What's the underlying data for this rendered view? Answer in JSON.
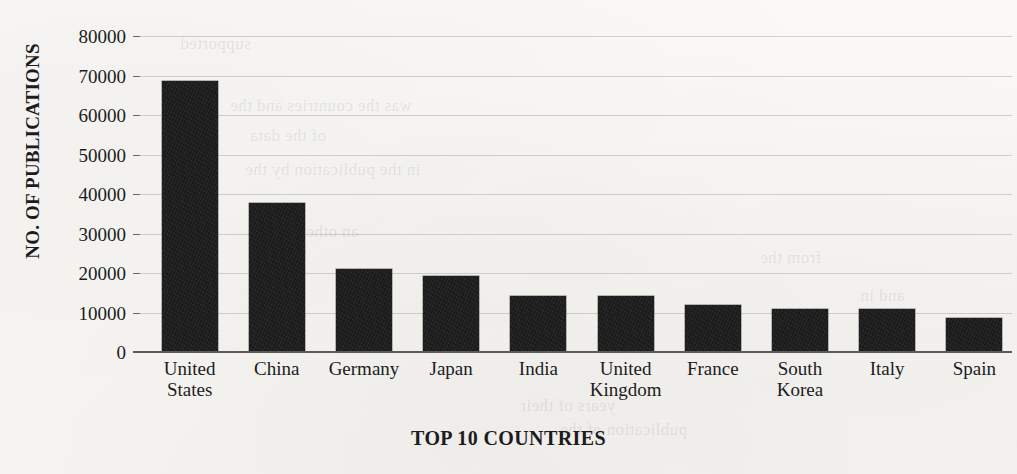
{
  "chart_data": {
    "type": "bar",
    "title": "",
    "xlabel": "TOP 10 COUNTRIES",
    "ylabel": "NO. OF PUBLICATIONS",
    "categories": [
      "United States",
      "China",
      "Germany",
      "Japan",
      "India",
      "United Kingdom",
      "France",
      "South Korea",
      "Italy",
      "Spain"
    ],
    "values": [
      68500,
      37800,
      21000,
      19300,
      14300,
      14200,
      11900,
      11000,
      10800,
      8600
    ],
    "ylim": [
      0,
      80000
    ],
    "ytick_labels": [
      "80000",
      "70000",
      "60000",
      "50000",
      "40000",
      "30000",
      "20000",
      "10000",
      "0"
    ],
    "ytick_values": [
      80000,
      70000,
      60000,
      50000,
      40000,
      30000,
      20000,
      10000,
      0
    ],
    "grid": true,
    "legend": false,
    "bar_color": "#1b1b1b",
    "background_color": "#f8f7f5"
  },
  "axis": {
    "y_title": "NO. OF PUBLICATIONS",
    "x_title": "TOP 10 COUNTRIES"
  },
  "category_labels": [
    {
      "line1": "United",
      "line2": "States"
    },
    {
      "line1": "China",
      "line2": ""
    },
    {
      "line1": "Germany",
      "line2": ""
    },
    {
      "line1": "Japan",
      "line2": ""
    },
    {
      "line1": "India",
      "line2": ""
    },
    {
      "line1": "United",
      "line2": "Kingdom"
    },
    {
      "line1": "France",
      "line2": ""
    },
    {
      "line1": "South",
      "line2": "Korea"
    },
    {
      "line1": "Italy",
      "line2": ""
    },
    {
      "line1": "Spain",
      "line2": ""
    }
  ],
  "bleed_through": [
    "supported",
    "was the countries and the",
    "of the data",
    "in the publication by the",
    "an other",
    "from the",
    "and in",
    "years of their",
    "publication of the"
  ]
}
